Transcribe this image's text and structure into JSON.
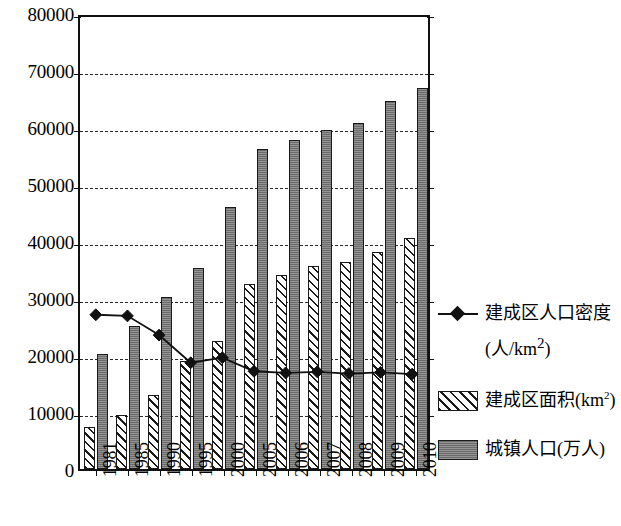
{
  "chart_data": {
    "type": "bar",
    "title": "",
    "subtitle": "",
    "xlabel": "",
    "ylabel": "",
    "ylim": [
      0,
      80000
    ],
    "ytick_step": 10000,
    "yticks": [
      "0",
      "10000",
      "20000",
      "30000",
      "40000",
      "50000",
      "60000",
      "70000",
      "80000"
    ],
    "grid": true,
    "grid_style": "dashed-horizontal",
    "legend_position": "right",
    "categories": [
      "1981",
      "1985",
      "1990",
      "1995",
      "2000",
      "2005",
      "2006",
      "2007",
      "2008",
      "2009",
      "2010"
    ],
    "series": [
      {
        "name": "建成区面积(km2)",
        "label_main": "建成区面积(km",
        "label_sup": "2",
        "label_tail": ")",
        "type": "bar",
        "style": "hatched",
        "color": "#ffffff",
        "edge_color": "#1a1a1a",
        "values": [
          7400,
          9400,
          13000,
          19000,
          22500,
          32500,
          34000,
          35600,
          36300,
          38100,
          40500
        ]
      },
      {
        "name": "城镇人口(万人)",
        "label_main": "城镇人口(万人)",
        "type": "bar",
        "style": "solid",
        "color": "#808080",
        "edge_color": "#1a1a1a",
        "values": [
          20100,
          25100,
          30200,
          35200,
          45900,
          56200,
          57700,
          59400,
          60700,
          64500,
          66900
        ]
      },
      {
        "name": "建成区人口密度 (人/km2)",
        "label_main": "建成区人口密度",
        "label_line2_main": "(人/km",
        "label_line2_sup": "2",
        "label_line2_tail": ")",
        "type": "line",
        "style": "line-diamond",
        "color": "#111111",
        "marker": "diamond",
        "values": [
          27300,
          27100,
          23700,
          18800,
          19700,
          17300,
          17000,
          17200,
          16900,
          17100,
          16800
        ]
      }
    ]
  },
  "legend": {
    "items": [
      {
        "kind": "line",
        "swatch": "diamond-line-swatch"
      },
      {
        "kind": "hatch",
        "swatch": "hatched-square-swatch"
      },
      {
        "kind": "solid",
        "swatch": "gray-square-swatch"
      }
    ]
  }
}
